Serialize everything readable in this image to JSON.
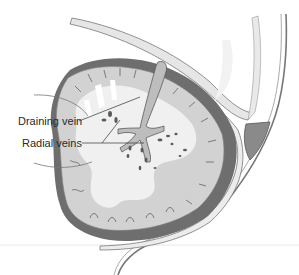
{
  "figure": {
    "labels": [
      {
        "id": "draining-vein",
        "text": "Draining vein"
      },
      {
        "id": "radial-veins",
        "text": "Radial veins"
      }
    ]
  },
  "colors": {
    "background": "#ffffff",
    "white_matter": "#f0f0f0",
    "gray_matter": "#d2d2d2",
    "cortex_dark": "#6e6e6e",
    "vein": "#bdbdbd",
    "vein_outline": "#5a5a5a",
    "sinus": "#8a8a8a",
    "dura": "#e6e6e6",
    "outline": "#555555",
    "label_text": "#2a2a2a"
  }
}
